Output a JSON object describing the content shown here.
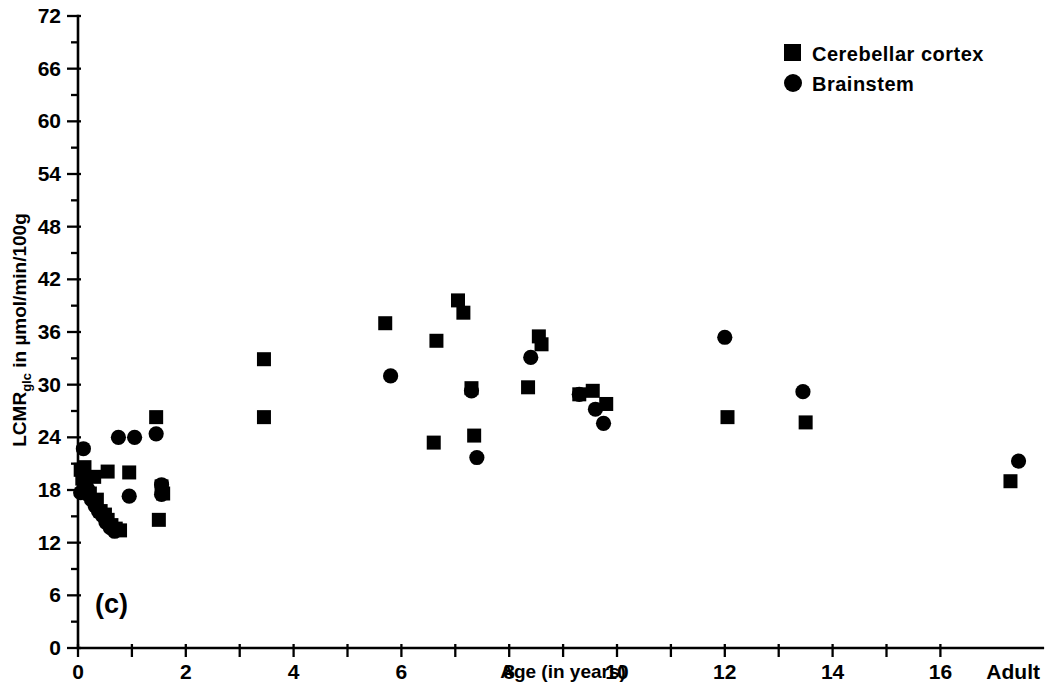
{
  "chart_data": {
    "type": "scatter",
    "title": "",
    "panel_label": "(c)",
    "xlabel": "Age (in years)",
    "ylabel": "LCMRglc in µmol/min/100g",
    "ylabel_main": "LCMR",
    "ylabel_sub": "glc",
    "ylabel_tail": " in µmol/min/100g",
    "xlim": [
      0,
      18
    ],
    "ylim": [
      0,
      72
    ],
    "grid": false,
    "x_tick_values": [
      0,
      1,
      2,
      3,
      4,
      5,
      6,
      7,
      8,
      9,
      10,
      11,
      12,
      13,
      14,
      15,
      16,
      17
    ],
    "x_tick_labels": [
      "0",
      "",
      "2",
      "",
      "4",
      "",
      "6",
      "",
      "8",
      "",
      "10",
      "",
      "12",
      "",
      "14",
      "",
      "16",
      "Adult"
    ],
    "y_tick_values": [
      0,
      3,
      6,
      9,
      12,
      15,
      18,
      21,
      24,
      27,
      30,
      33,
      36,
      39,
      42,
      45,
      48,
      51,
      54,
      57,
      60,
      63,
      66,
      69,
      72
    ],
    "y_tick_labels": [
      "0",
      "",
      "6",
      "",
      "12",
      "",
      "18",
      "",
      "24",
      "",
      "30",
      "",
      "36",
      "",
      "42",
      "",
      "48",
      "",
      "54",
      "",
      "60",
      "",
      "66",
      "",
      "72"
    ],
    "y_major_labels": [
      "0",
      "6",
      "12",
      "18",
      "24",
      "30",
      "36",
      "42",
      "48",
      "54",
      "60",
      "66",
      "72"
    ],
    "adult_x": 17.35,
    "legend_position": "top-right",
    "series": [
      {
        "name": "Cerebellar cortex",
        "marker": "square",
        "color": "#000000",
        "points": [
          [
            0.05,
            20.3
          ],
          [
            0.08,
            19.3
          ],
          [
            0.12,
            20.6
          ],
          [
            0.15,
            18.0
          ],
          [
            0.22,
            17.6
          ],
          [
            0.3,
            19.5
          ],
          [
            0.35,
            16.9
          ],
          [
            0.42,
            15.6
          ],
          [
            0.5,
            15.2
          ],
          [
            0.55,
            14.6
          ],
          [
            0.62,
            14.0
          ],
          [
            0.7,
            13.6
          ],
          [
            0.78,
            13.4
          ],
          [
            0.55,
            20.1
          ],
          [
            0.95,
            20.0
          ],
          [
            1.45,
            26.3
          ],
          [
            1.55,
            18.4
          ],
          [
            1.58,
            17.6
          ],
          [
            1.5,
            14.6
          ],
          [
            3.45,
            32.9
          ],
          [
            3.45,
            26.3
          ],
          [
            5.7,
            37.0
          ],
          [
            6.65,
            35.0
          ],
          [
            6.6,
            23.4
          ],
          [
            7.05,
            39.6
          ],
          [
            7.15,
            38.2
          ],
          [
            7.35,
            24.2
          ],
          [
            7.3,
            29.6
          ],
          [
            8.35,
            29.7
          ],
          [
            8.55,
            35.5
          ],
          [
            8.6,
            34.6
          ],
          [
            9.3,
            28.9
          ],
          [
            9.55,
            29.3
          ],
          [
            9.8,
            27.8
          ],
          [
            12.05,
            26.3
          ],
          [
            13.5,
            25.7
          ],
          [
            17.3,
            19.0
          ]
        ]
      },
      {
        "name": "Brainstem",
        "marker": "circle",
        "color": "#000000",
        "points": [
          [
            0.05,
            17.7
          ],
          [
            0.1,
            22.7
          ],
          [
            0.18,
            18.1
          ],
          [
            0.25,
            16.9
          ],
          [
            0.32,
            16.2
          ],
          [
            0.38,
            15.6
          ],
          [
            0.45,
            15.1
          ],
          [
            0.52,
            14.3
          ],
          [
            0.6,
            13.7
          ],
          [
            0.68,
            13.3
          ],
          [
            0.75,
            24.0
          ],
          [
            0.95,
            17.3
          ],
          [
            1.05,
            24.0
          ],
          [
            1.45,
            24.4
          ],
          [
            1.55,
            18.6
          ],
          [
            1.55,
            17.5
          ],
          [
            5.8,
            31.0
          ],
          [
            7.3,
            29.3
          ],
          [
            7.4,
            21.7
          ],
          [
            8.4,
            33.1
          ],
          [
            9.3,
            28.9
          ],
          [
            9.6,
            27.2
          ],
          [
            9.75,
            25.6
          ],
          [
            12.0,
            35.4
          ],
          [
            13.45,
            29.2
          ],
          [
            17.45,
            21.3
          ]
        ]
      }
    ]
  },
  "legend": {
    "items": [
      {
        "label": "Cerebellar cortex",
        "marker": "square"
      },
      {
        "label": "Brainstem",
        "marker": "circle"
      }
    ]
  }
}
